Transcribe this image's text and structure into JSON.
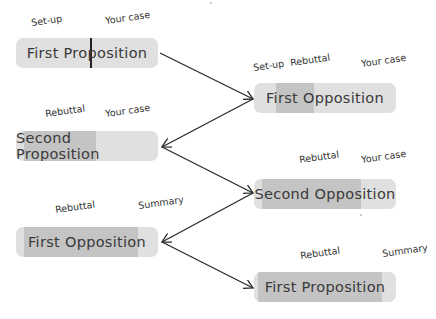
{
  "diagram": {
    "speeches": [
      {
        "name": "First Proposition",
        "box": {
          "x": 16,
          "y": 38
        },
        "segments": [],
        "divider_x": 90,
        "labels": [
          {
            "text": "Set-up",
            "x": 32,
            "y": 17
          },
          {
            "text": "Your case",
            "x": 106,
            "y": 15
          }
        ]
      },
      {
        "name": "First Opposition",
        "box": {
          "x": 254,
          "y": 83
        },
        "segments": [
          {
            "from": 276,
            "to": 314
          }
        ],
        "labels": [
          {
            "text": "Set-up",
            "x": 254,
            "y": 62
          },
          {
            "text": "Rebuttal",
            "x": 291,
            "y": 57
          },
          {
            "text": "Your case",
            "x": 362,
            "y": 58
          }
        ]
      },
      {
        "name": "Second Proposition",
        "box": {
          "x": 16,
          "y": 131
        },
        "segments": [
          {
            "from": 24,
            "to": 96
          }
        ],
        "labels": [
          {
            "text": "Rebuttal",
            "x": 46,
            "y": 108
          },
          {
            "text": "Your case",
            "x": 106,
            "y": 108
          }
        ]
      },
      {
        "name": "Second Opposition",
        "box": {
          "x": 254,
          "y": 179
        },
        "segments": [
          {
            "from": 262,
            "to": 361
          }
        ],
        "labels": [
          {
            "text": "Rebuttal",
            "x": 300,
            "y": 154
          },
          {
            "text": "Your case",
            "x": 362,
            "y": 154
          }
        ]
      },
      {
        "name": "First Opposition",
        "box": {
          "x": 16,
          "y": 227
        },
        "segments": [
          {
            "from": 24,
            "to": 138
          }
        ],
        "labels": [
          {
            "text": "Rebuttal",
            "x": 56,
            "y": 204
          },
          {
            "text": "Summary",
            "x": 139,
            "y": 200
          }
        ]
      },
      {
        "name": "First Proposition",
        "box": {
          "x": 254,
          "y": 272
        },
        "segments": [
          {
            "from": 258,
            "to": 382
          }
        ],
        "labels": [
          {
            "text": "Rebuttal",
            "x": 301,
            "y": 250
          },
          {
            "text": "Summary",
            "x": 383,
            "y": 248
          }
        ]
      }
    ],
    "arrows": [
      {
        "from": [
          160,
          53
        ],
        "to": [
          253,
          99
        ]
      },
      {
        "from": [
          253,
          99
        ],
        "to": [
          162,
          147
        ]
      },
      {
        "from": [
          162,
          147
        ],
        "to": [
          253,
          193
        ]
      },
      {
        "from": [
          253,
          193
        ],
        "to": [
          162,
          242
        ]
      },
      {
        "from": [
          162,
          242
        ],
        "to": [
          253,
          288
        ]
      }
    ],
    "colors": {
      "box_light": "#e0e0e0",
      "box_dark": "#c4c4c4",
      "arrow": "#2a2a2a",
      "text": "#3a3a3a"
    }
  }
}
